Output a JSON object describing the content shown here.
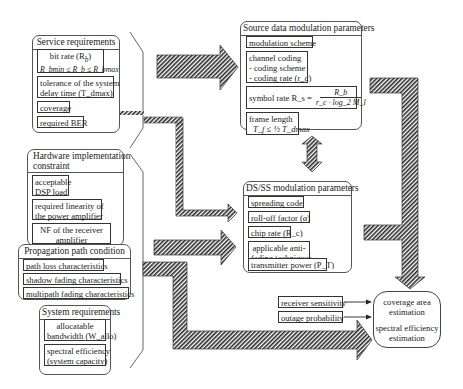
{
  "service_requirements": {
    "title": "Service requirements",
    "bit_rate_line1": "bit rate (R",
    "bit_rate_sub": "b",
    "bit_rate_close": ")",
    "bit_rate_line2": "R_bmin ≤ R_b ≤ R_bmax",
    "delay_line1": "tolerance of the system",
    "delay_line2": "delay time (T_dmax)",
    "coverage": "coverage",
    "required_ber": "required BER"
  },
  "hardware_constraint": {
    "title_line1": "Hardware implementation",
    "title_line2": "constraint",
    "dsp_line1": "acceptable",
    "dsp_line2": "DSP load",
    "linearity_line1": "required linearity of",
    "linearity_line2": "the power amplifier",
    "nf_line1": "NF of the receiver",
    "nf_line2": "amplifier"
  },
  "propagation_condition": {
    "title": "Propagation path condition",
    "path_loss": "path loss characteristics",
    "shadow_fading": "shadow fading characteristics",
    "multipath_fading": "multipath fading characteristics"
  },
  "system_requirements": {
    "title": "System requirements",
    "bandwidth_line1": "allocatable",
    "bandwidth_line2": "bandwidth (W_allo)",
    "spectral_line1": "spectral efficiency",
    "spectral_line2": "(system capacity)"
  },
  "source_modulation": {
    "title": "Source data modulation parameters",
    "modulation_scheme": "modulation scheme",
    "channel_coding_line1": "channel coding",
    "channel_coding_line2": "- coding scheme",
    "channel_coding_line3": "- coding rate (r_c)",
    "symbol_rate_label": "symbol rate R_s =",
    "symbol_rate_num": "R_b",
    "symbol_rate_den": "r_c · log_2 M_l",
    "frame_length_label": "frame length",
    "frame_length_formula": "T_f ≤ ½ T_dmax"
  },
  "dsss_modulation": {
    "title": "DS/SS modulation parameters",
    "spreading_code": "spreading code",
    "rolloff": "roll-off factor (α)",
    "chip_rate": "chip rate (R_c)",
    "antifading_line1": "applicable anti-",
    "antifading_line2": "fading techniques",
    "tx_power": "transmitter power (P_T)"
  },
  "receiver_inputs": {
    "receiver_sensitivity": "receiver sensitivity",
    "outage_probability": "outage probability"
  },
  "estimation": {
    "coverage_line1": "coverage area",
    "coverage_line2": "estimation",
    "spectral_line1": "spectral efficiency",
    "spectral_line2": "estimation"
  },
  "colors": {
    "arrow_hatch": "#333333",
    "border": "#444444",
    "background": "#ffffff"
  }
}
